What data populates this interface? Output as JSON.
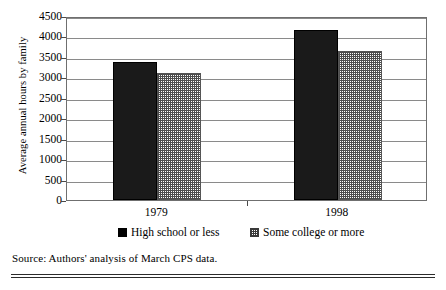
{
  "chart_data": {
    "type": "bar",
    "title": "",
    "subtitle": "",
    "xlabel": "",
    "ylabel": "Average annual hours by family",
    "categories": [
      "1979",
      "1998"
    ],
    "series": [
      {
        "name": "High school or less",
        "values": [
          3380,
          4170
        ],
        "fill": "solid-black"
      },
      {
        "name": "Some college or more",
        "values": [
          3100,
          3650
        ],
        "fill": "gray-hatch"
      }
    ],
    "ylim": [
      0,
      4500
    ],
    "ytick_values": [
      0,
      500,
      1000,
      1500,
      2000,
      2500,
      3000,
      3500,
      4000,
      4500
    ],
    "ytick_labels": [
      "0",
      "500",
      "1000",
      "1500",
      "2000",
      "2500",
      "3000",
      "3500",
      "4000",
      "4500"
    ],
    "grid": "horizontal",
    "legend_position": "bottom",
    "bar_colors": {
      "solid": "#1a1a1a",
      "hatch_fg": "#4d4d4d",
      "hatch_bg": "#ffffff"
    },
    "axis_color": "#6f6f6f",
    "gridline_color": "#8a8a8a"
  },
  "source": {
    "text": "Source: Authors' analysis of March CPS data."
  }
}
